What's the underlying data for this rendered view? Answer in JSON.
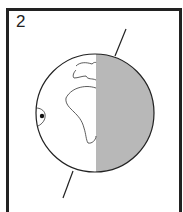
{
  "panel": {
    "number": "2",
    "subject": "Earth globe with day/night terminator",
    "colors": {
      "night": "#b8b8b8",
      "day": "#ffffff",
      "outline": "#222222"
    },
    "marker": "location-dot"
  }
}
